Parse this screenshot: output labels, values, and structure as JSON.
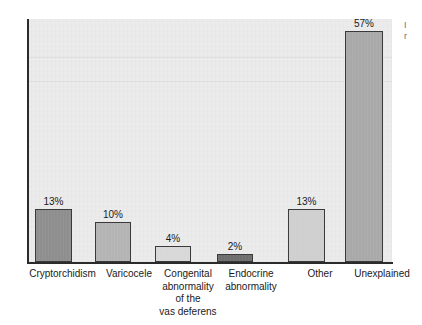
{
  "chart_data": {
    "type": "bar",
    "title": "",
    "subtitle": "",
    "xlabel": "",
    "ylabel": "",
    "ylim": [
      0,
      60
    ],
    "grid": false,
    "legend": null,
    "unit": "%",
    "categories": [
      "Cryptorchidism",
      "Varicocele",
      "Congenital abnormality of the vas deferens",
      "Endocrine abnormality",
      "Other",
      "Unexplained"
    ],
    "values": [
      13,
      10,
      4,
      2,
      13,
      57
    ],
    "data_labels": [
      "13%",
      "10%",
      "4%",
      "2%",
      "13%",
      "57%"
    ],
    "bar_colors": [
      "#8e8e8e",
      "#b4b4b4",
      "#d8d8d8",
      "#6e6e6e",
      "#cfcfcf",
      "#a9a9a9"
    ],
    "plot_background": "#ebebeb",
    "axis_color": "#2b2b2b"
  },
  "axis_labels": {
    "lines": [
      [
        "Cryptorchidism"
      ],
      [
        "Varicocele"
      ],
      [
        "Congenital",
        "abnormality",
        "of the",
        "vas deferens"
      ],
      [
        "Endocrine",
        "abnormality"
      ],
      [
        "Other"
      ],
      [
        "Unexplained"
      ]
    ]
  },
  "margin_note": {
    "line1": "I",
    "line2": "r"
  }
}
